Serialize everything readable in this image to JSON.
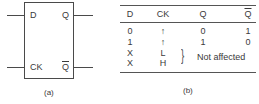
{
  "figure_a": {
    "inputs": {
      "d": "D",
      "ck": "CK"
    },
    "outputs": {
      "q": "Q",
      "q_bar": "Q"
    },
    "caption": "(a)"
  },
  "figure_b": {
    "headers": [
      "D",
      "CK",
      "Q",
      "Q"
    ],
    "rows": [
      [
        "0",
        "↑",
        "0",
        "1"
      ],
      [
        "1",
        "↑",
        "1",
        "0"
      ],
      [
        "X",
        "L",
        "",
        ""
      ],
      [
        "X",
        "H",
        "",
        ""
      ]
    ],
    "note": "Not affected",
    "caption": "(b)"
  }
}
